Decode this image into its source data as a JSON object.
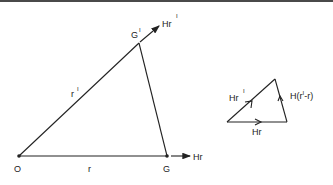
{
  "diagram": {
    "main_triangle": {
      "vertices": {
        "origin": "O",
        "g": "G",
        "g_prime": "G",
        "g_prime_mark": "I"
      },
      "sides": {
        "base": "r",
        "hyp": "r",
        "hyp_mark": "I"
      },
      "vectors": {
        "at_g": "Hr",
        "at_g_prime": "Hr",
        "at_g_prime_mark": "I"
      }
    },
    "vector_triangle": {
      "sides": {
        "base": "Hr",
        "hyp": "Hr",
        "hyp_mark": "I",
        "right": "H(r",
        "right_mark": "I",
        "right_tail": "-r)"
      }
    }
  }
}
